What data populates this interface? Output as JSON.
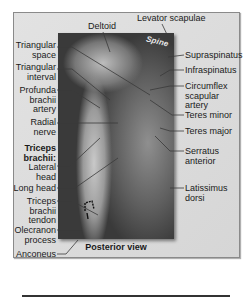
{
  "figure": {
    "caption": "Posterior view",
    "photo_annotation": "Spine",
    "labels_top": [
      {
        "text": "Deltoid"
      },
      {
        "text": "Levator scapulae"
      }
    ],
    "labels_left": [
      {
        "lines": [
          "Triangular",
          "space"
        ]
      },
      {
        "lines": [
          "Triangular",
          "interval"
        ]
      },
      {
        "lines": [
          "Profunda",
          "brachii",
          "artery"
        ]
      },
      {
        "lines": [
          "Radial",
          "nerve"
        ]
      },
      {
        "heading": [
          "Triceps",
          "brachii:"
        ],
        "lines": [
          "Lateral",
          "head"
        ]
      },
      {
        "lines": [
          "Long head"
        ]
      },
      {
        "lines": [
          "Triceps",
          "brachii",
          "tendon"
        ]
      },
      {
        "lines": [
          "Olecranon",
          "process"
        ]
      },
      {
        "lines": [
          "Anconeus"
        ]
      }
    ],
    "labels_right": [
      {
        "lines": [
          "Supraspinatus"
        ]
      },
      {
        "lines": [
          "Infraspinatus"
        ]
      },
      {
        "lines": [
          "Circumflex",
          "scapular",
          "artery"
        ]
      },
      {
        "lines": [
          "Teres minor"
        ]
      },
      {
        "lines": [
          "Teres major"
        ]
      },
      {
        "lines": [
          "Serratus",
          "anterior"
        ]
      },
      {
        "lines": [
          "Latissimus",
          "dorsi"
        ]
      }
    ],
    "colors": {
      "frame_bg": "#d9d9d9",
      "frame_border": "#8a8a8a",
      "text": "#1a1a1a",
      "leader_line": "#3a3a3a",
      "photo_bg": "#0a0a0a"
    }
  }
}
